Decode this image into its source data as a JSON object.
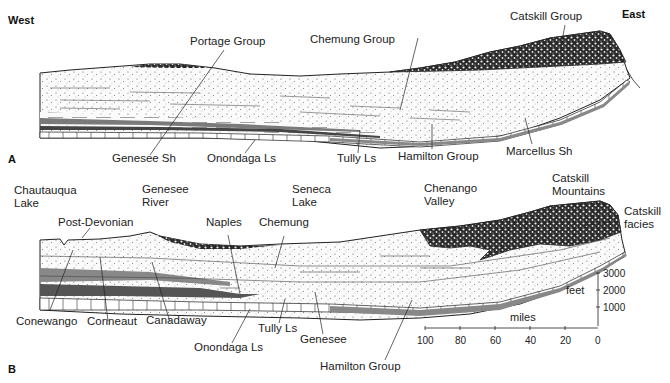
{
  "figure": {
    "panel_a": {
      "letter": "A",
      "direction_west": "West",
      "direction_east": "East",
      "labels_top": [
        "Portage Group",
        "Chemung Group",
        "Catskill Group"
      ],
      "labels_bottom": [
        "Genesee Sh",
        "Onondaga Ls",
        "Tully Ls",
        "Hamilton Group",
        "Marcellus Sh"
      ]
    },
    "panel_b": {
      "letter": "B",
      "places": [
        {
          "line1": "Chautauqua",
          "line2": "Lake"
        },
        {
          "line1": "Genesee",
          "line2": "River"
        },
        {
          "line1": "Seneca",
          "line2": "Lake"
        },
        {
          "line1": "Chenango",
          "line2": "Valley"
        },
        {
          "line1": "Catskill",
          "line2": "Mountains"
        }
      ],
      "labels_top": [
        "Post-Devonian",
        "Naples",
        "Chemung"
      ],
      "catskill_facies": {
        "line1": "Catskill",
        "line2": "facies"
      },
      "labels_bottom": [
        "Conewango",
        "Conneaut",
        "Canadaway",
        "Tully Ls",
        "Onondaga Ls",
        "Genesee",
        "Hamilton Group"
      ],
      "scale": {
        "vertical_label": "feet",
        "vertical_ticks": [
          "3000",
          "2000",
          "1000"
        ],
        "horizontal_label": "miles",
        "horizontal_ticks": [
          "100",
          "80",
          "60",
          "40",
          "20",
          "0"
        ]
      }
    }
  }
}
